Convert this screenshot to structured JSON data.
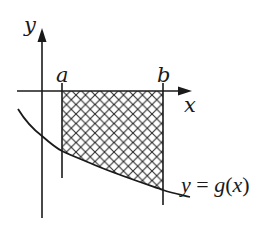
{
  "diagram": {
    "type": "area-under-curve",
    "labels": {
      "y_axis": "y",
      "x_axis": "x",
      "lower_bound": "a",
      "upper_bound": "b",
      "curve": "y = g(x)"
    },
    "colors": {
      "stroke": "#1a1a1a",
      "background": "#ffffff",
      "hatch": "#2a2a2a"
    },
    "region": {
      "description": "Cross-hatched region between x-axis and curve y = g(x) from x = a to x = b",
      "fill_pattern": "cross-hatch"
    }
  }
}
